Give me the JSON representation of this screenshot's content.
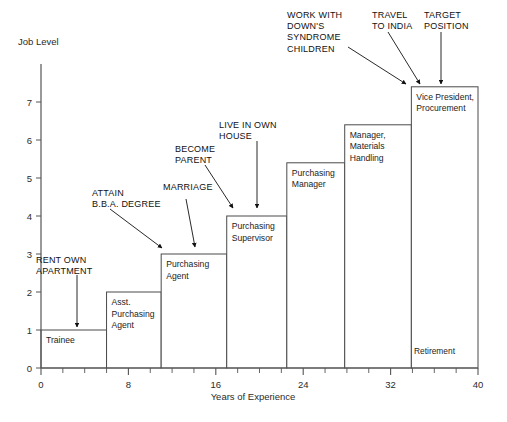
{
  "chart_data": {
    "type": "bar",
    "title": "",
    "xlabel": "Years of Experience",
    "ylabel": "Job Level",
    "xlim": [
      0,
      40
    ],
    "ylim": [
      0,
      8
    ],
    "grid": false,
    "legend": "none",
    "x_ticks": [
      0,
      8,
      16,
      24,
      32,
      40
    ],
    "x_tick_labels": [
      "0",
      "8",
      "16",
      "24",
      "32",
      "40"
    ],
    "x_minor_step": 2,
    "y_ticks": [
      0,
      1,
      2,
      3,
      4,
      5,
      6,
      7
    ],
    "y_tick_labels": [
      "0",
      "1",
      "2",
      "3",
      "4",
      "5",
      "6",
      "7"
    ],
    "categories": [
      "Trainee",
      "Asst. Purchasing Agent",
      "Purchasing Agent",
      "Purchasing Supervisor",
      "Purchasing Manager",
      "Manager, Materials Handling",
      "Vice President, Procurement"
    ],
    "values": [
      1,
      2,
      3,
      4,
      5.4,
      6.4,
      7.4
    ],
    "steps": [
      {
        "label": "Trainee",
        "x_start": 0,
        "x_end": 6,
        "level": 1.0,
        "label_lines": [
          "Trainee"
        ]
      },
      {
        "label": "Asst. Purchasing Agent",
        "x_start": 6,
        "x_end": 11,
        "level": 2.0,
        "label_lines": [
          "Asst.",
          "Purchasing",
          "Agent"
        ]
      },
      {
        "label": "Purchasing Agent",
        "x_start": 11,
        "x_end": 17,
        "level": 3.0,
        "label_lines": [
          "Purchasing",
          "Agent"
        ]
      },
      {
        "label": "Purchasing Supervisor",
        "x_start": 17,
        "x_end": 22.5,
        "level": 4.0,
        "label_lines": [
          "Purchasing",
          "Supervisor"
        ]
      },
      {
        "label": "Purchasing Manager",
        "x_start": 22.5,
        "x_end": 27.8,
        "level": 5.4,
        "label_lines": [
          "Purchasing",
          "Manager"
        ]
      },
      {
        "label": "Manager, Materials Handling",
        "x_start": 27.8,
        "x_end": 33.9,
        "level": 6.4,
        "label_lines": [
          "Manager,",
          "Materials",
          "Handling"
        ]
      },
      {
        "label": "Vice President, Procurement",
        "x_start": 33.9,
        "x_end": 40,
        "level": 7.4,
        "label_lines": [
          "Vice President,",
          "Procurement"
        ]
      }
    ],
    "annotations": [
      {
        "name": "rent-own-apartment",
        "lines": [
          "RENT OWN",
          "APARTMENT"
        ],
        "text_x": 36,
        "text_y": 263,
        "align": "start",
        "arrow": [
          [
            77,
            275
          ],
          [
            77,
            327
          ]
        ]
      },
      {
        "name": "attain-bba-degree",
        "lines": [
          "ATTAIN",
          "B.B.A. DEGREE"
        ],
        "text_x": 92,
        "text_y": 196,
        "align": "start",
        "arrow": [
          [
            110,
            209
          ],
          [
            162,
            248
          ]
        ]
      },
      {
        "name": "marriage",
        "lines": [
          "MARRIAGE"
        ],
        "text_x": 163,
        "text_y": 190,
        "align": "start",
        "arrow": [
          [
            186,
            199
          ],
          [
            195,
            247
          ]
        ]
      },
      {
        "name": "become-parent",
        "lines": [
          "BECOME",
          "PARENT"
        ],
        "text_x": 175,
        "text_y": 152,
        "align": "start",
        "arrow": [
          [
            205,
            165
          ],
          [
            233,
            208
          ]
        ]
      },
      {
        "name": "live-in-own-house",
        "lines": [
          "LIVE IN OWN",
          "HOUSE"
        ],
        "text_x": 219,
        "text_y": 128,
        "align": "start",
        "arrow": [
          [
            257,
            141
          ],
          [
            257,
            208
          ]
        ]
      },
      {
        "name": "work-with-downs-syndrome-children",
        "lines": [
          "WORK WITH",
          "DOWN'S",
          "SYNDROME",
          "CHILDREN"
        ],
        "text_x": 287,
        "text_y": 18,
        "align": "start",
        "arrow": [
          [
            348,
            47
          ],
          [
            406,
            84
          ]
        ]
      },
      {
        "name": "travel-to-india",
        "lines": [
          "TRAVEL",
          "TO INDIA"
        ],
        "text_x": 372,
        "text_y": 18,
        "align": "start",
        "arrow": [
          [
            388,
            32
          ],
          [
            420,
            84
          ]
        ]
      },
      {
        "name": "target-position",
        "lines": [
          "TARGET",
          "POSITION"
        ],
        "text_x": 424,
        "text_y": 18,
        "align": "start",
        "arrow": [
          [
            441,
            32
          ],
          [
            441,
            84
          ]
        ]
      }
    ],
    "extra_labels": [
      {
        "name": "retirement-label",
        "text": "Retirement",
        "x": 414,
        "y": 354
      }
    ]
  }
}
